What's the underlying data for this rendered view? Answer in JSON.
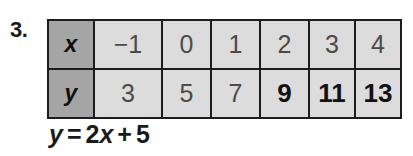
{
  "problem": {
    "number": "3."
  },
  "table": {
    "row_labels": {
      "x": "x",
      "y": "y"
    },
    "x_values": [
      "−1",
      "0",
      "1",
      "2",
      "3",
      "4"
    ],
    "y_values": [
      "3",
      "5",
      "7",
      "9",
      "11",
      "13"
    ],
    "y_bold_flags": [
      false,
      false,
      false,
      true,
      true,
      true
    ]
  },
  "equation": {
    "lhs": "y",
    "equals": "=",
    "coefficient": "2",
    "variable": "x",
    "plus": "+",
    "constant": "5",
    "full_text": "y = 2x + 5"
  },
  "colors": {
    "header_cell": "#a5a5a5",
    "data_cell": "#dcdcdc",
    "border": "#1c1c1c",
    "printed_text": "#4a4a4a",
    "answer_text": "#111111",
    "page_background": "#ffffff"
  }
}
